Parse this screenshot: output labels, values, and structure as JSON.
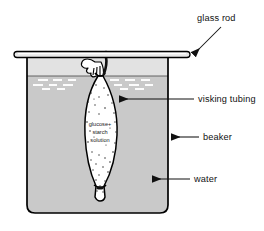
{
  "figure": {
    "type": "science-diagram"
  },
  "labels": {
    "glass_rod": "glass rod",
    "visking_tubing": "visking tubing",
    "beaker": "beaker",
    "water": "water"
  },
  "contents": {
    "line1": "glucose+",
    "line2": "starch",
    "line3": "solution"
  },
  "colors": {
    "outline": "#000000",
    "water_fill": "#c9c9c9",
    "beaker_glass": "#d6d6d6",
    "tubing_fill": "#ffffff",
    "rod_fill": "#e8e8e8",
    "label": "#111111",
    "speckle": "#2b2b2b",
    "surface_dash": "#ffffff",
    "background": "#ffffff"
  }
}
